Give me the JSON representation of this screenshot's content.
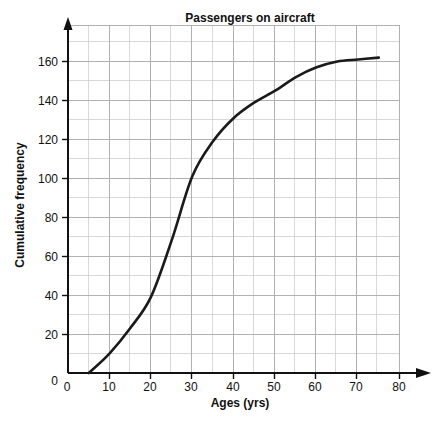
{
  "chart_data": {
    "type": "line",
    "title": "Passengers on aircraft",
    "xlabel": "Ages (yrs)",
    "ylabel": "Cumulative frequency",
    "xlim": [
      0,
      80
    ],
    "ylim": [
      0,
      170
    ],
    "grid": "on",
    "legend": "none",
    "x_ticks": [
      "0",
      "10",
      "20",
      "30",
      "40",
      "50",
      "60",
      "70",
      "80"
    ],
    "x_tick_values": [
      0,
      10,
      20,
      30,
      40,
      50,
      60,
      70,
      80
    ],
    "x_minor_step": 5,
    "y_ticks": [
      "0",
      "20",
      "40",
      "60",
      "80",
      "100",
      "120",
      "140",
      "160"
    ],
    "y_tick_values": [
      0,
      20,
      40,
      60,
      80,
      100,
      120,
      140,
      160
    ],
    "y_minor_step": 10,
    "series": [
      {
        "name": "Cumulative frequency",
        "color": "#1a1a1a",
        "x": [
          5,
          10,
          15,
          20,
          25,
          30,
          35,
          40,
          45,
          50,
          55,
          60,
          65,
          70,
          75
        ],
        "values": [
          0,
          10,
          23,
          39,
          68,
          101,
          119,
          131,
          139,
          145,
          152,
          157,
          160,
          161,
          162
        ]
      }
    ],
    "annotations": []
  },
  "axes": {
    "x_arrow": "arrow-right",
    "y_arrow": "arrow-up"
  }
}
